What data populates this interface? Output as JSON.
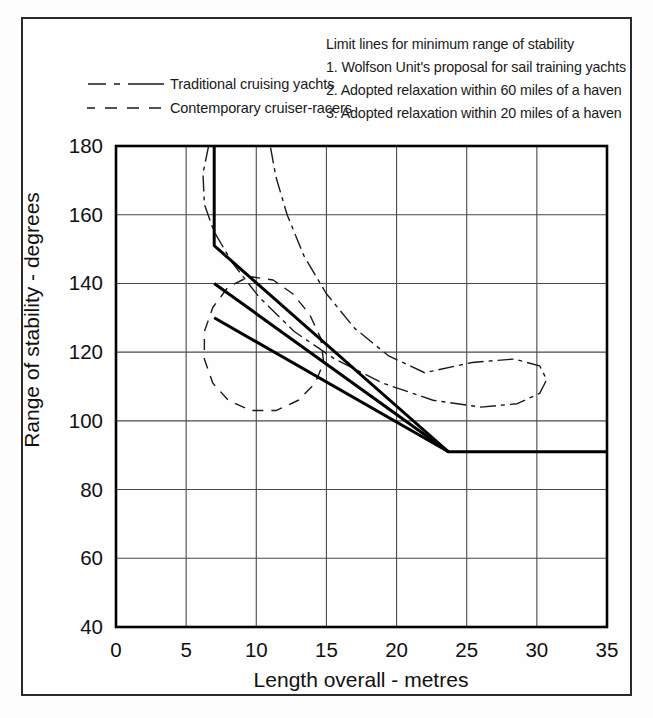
{
  "figure": {
    "background_color": "#fdfdfd",
    "frame_color": "#2a2a2a",
    "line_color": "#000000",
    "grid_color": "#4a4a4a"
  },
  "legend": {
    "entries": [
      {
        "label": "Traditional cruising yachts",
        "style": "dash-dot"
      },
      {
        "label": "Contemporary cruiser-racers",
        "style": "dashed"
      }
    ]
  },
  "limit_lines_note": {
    "heading": "Limit lines for minimum range of stability",
    "items": [
      "1. Wolfson Unit's proposal for sail training yachts",
      "2. Adopted relaxation within 60 miles of a haven",
      "3. Adopted relaxation within 20 miles of a haven"
    ]
  },
  "curve_labels": [
    "1",
    "2",
    "3"
  ],
  "chart_data": {
    "type": "line",
    "title": "",
    "xlabel": "Length overall - metres",
    "ylabel": "Range of stability - degrees",
    "xlim": [
      0,
      35
    ],
    "ylim": [
      40,
      180
    ],
    "xticks": [
      0,
      5,
      10,
      15,
      20,
      25,
      30,
      35
    ],
    "yticks": [
      40,
      60,
      80,
      100,
      120,
      140,
      160,
      180
    ],
    "grid": true,
    "legend_position": "above-left",
    "series": [
      {
        "name": "1. Wolfson Unit's proposal for sail training yachts",
        "label": "1",
        "style": "solid",
        "width": 3,
        "points": [
          [
            7.0,
            180
          ],
          [
            7.0,
            151
          ],
          [
            23.7,
            91
          ],
          [
            35.0,
            91
          ]
        ]
      },
      {
        "name": "2. Adopted relaxation within 60 miles of a haven",
        "label": "2",
        "style": "solid",
        "width": 3,
        "points": [
          [
            7.0,
            140
          ],
          [
            23.7,
            91
          ]
        ]
      },
      {
        "name": "3. Adopted relaxation within 20 miles of a haven",
        "label": "3",
        "style": "solid",
        "width": 3,
        "points": [
          [
            7.0,
            130
          ],
          [
            23.7,
            91
          ]
        ]
      },
      {
        "name": "Traditional cruising yachts",
        "style": "dash-dot",
        "width": 1.4,
        "envelope": [
          [
            6.6,
            180
          ],
          [
            6.2,
            172
          ],
          [
            6.3,
            163
          ],
          [
            7.0,
            155
          ],
          [
            8.3,
            146
          ],
          [
            10.2,
            136
          ],
          [
            12.7,
            126
          ],
          [
            15.6,
            118
          ],
          [
            19.0,
            111
          ],
          [
            22.6,
            106
          ],
          [
            26.0,
            104
          ],
          [
            28.6,
            105
          ],
          [
            30.2,
            108
          ],
          [
            30.7,
            112
          ],
          [
            30.2,
            116
          ],
          [
            28.4,
            118
          ],
          [
            25.4,
            117
          ],
          [
            22.0,
            114
          ],
          [
            19.4,
            119
          ],
          [
            17.0,
            127
          ],
          [
            15.0,
            137
          ],
          [
            13.4,
            148
          ],
          [
            12.2,
            160
          ],
          [
            11.4,
            171
          ],
          [
            11.0,
            180
          ]
        ]
      },
      {
        "name": "Contemporary cruiser-racers",
        "style": "dashed",
        "width": 1.4,
        "envelope": [
          [
            9.5,
            142
          ],
          [
            11.2,
            141
          ],
          [
            12.6,
            137
          ],
          [
            13.8,
            131
          ],
          [
            14.6,
            124
          ],
          [
            14.8,
            117
          ],
          [
            14.2,
            111
          ],
          [
            13.0,
            106
          ],
          [
            11.4,
            103
          ],
          [
            9.6,
            103
          ],
          [
            8.0,
            106
          ],
          [
            6.9,
            111
          ],
          [
            6.3,
            118
          ],
          [
            6.3,
            126
          ],
          [
            6.9,
            133
          ],
          [
            8.0,
            139
          ],
          [
            9.5,
            142
          ]
        ]
      }
    ]
  }
}
